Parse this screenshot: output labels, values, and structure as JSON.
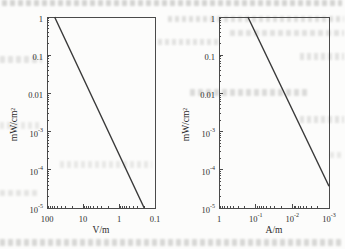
{
  "page": {
    "background_color": "#fcfcfb",
    "axis_color": "#4a4a4a",
    "text_color": "#2e2e2e"
  },
  "chart_data": [
    {
      "type": "line",
      "id": "power-density-vs-electric-field",
      "title": "",
      "xlabel": "V/m",
      "ylabel": "mW/cm²",
      "x_scale": "log",
      "y_scale": "log",
      "x_reversed": true,
      "x_range": [
        100,
        0.1
      ],
      "y_range": [
        1,
        1e-05
      ],
      "grid": false,
      "minor_ticks": true,
      "tick_direction": "in",
      "frame": "box",
      "x_ticks": [
        {
          "value": 100,
          "base": "100",
          "exp": ""
        },
        {
          "value": 10,
          "base": "10",
          "exp": ""
        },
        {
          "value": 1,
          "base": "1",
          "exp": ""
        },
        {
          "value": 0.1,
          "base": "0.1",
          "exp": ""
        }
      ],
      "y_ticks": [
        {
          "value": 1,
          "base": "1",
          "exp": ""
        },
        {
          "value": 0.1,
          "base": "0.1",
          "exp": ""
        },
        {
          "value": 0.01,
          "base": "0.01",
          "exp": ""
        },
        {
          "value": 0.001,
          "base": "10",
          "exp": "-3"
        },
        {
          "value": 0.0001,
          "base": "10",
          "exp": "-4"
        },
        {
          "value": 1e-05,
          "base": "10",
          "exp": "-5"
        }
      ],
      "series": [
        {
          "name": "power-density-vs-E-field-line",
          "color": "#383838",
          "points": [
            [
              61.4,
              1
            ],
            [
              0.2,
              1e-05
            ]
          ]
        }
      ]
    },
    {
      "type": "line",
      "id": "power-density-vs-magnetic-field",
      "title": "",
      "xlabel": "A/m",
      "ylabel": "mW/cm²",
      "x_scale": "log",
      "y_scale": "log",
      "x_reversed": true,
      "x_range": [
        1,
        0.001
      ],
      "y_range": [
        1,
        1e-05
      ],
      "grid": false,
      "minor_ticks": true,
      "tick_direction": "in",
      "frame": "box",
      "x_ticks": [
        {
          "value": 1,
          "base": "1",
          "exp": ""
        },
        {
          "value": 0.1,
          "base": "10",
          "exp": "-1"
        },
        {
          "value": 0.01,
          "base": "10",
          "exp": "-2"
        },
        {
          "value": 0.001,
          "base": "10",
          "exp": "-3"
        }
      ],
      "y_ticks": [
        {
          "value": 1,
          "base": "1",
          "exp": ""
        },
        {
          "value": 0.1,
          "base": "0.1",
          "exp": ""
        },
        {
          "value": 0.01,
          "base": "0.01",
          "exp": ""
        },
        {
          "value": 0.001,
          "base": "10",
          "exp": "-3"
        },
        {
          "value": 0.0001,
          "base": "10",
          "exp": "-4"
        },
        {
          "value": 1e-05,
          "base": "10",
          "exp": "-5"
        }
      ],
      "series": [
        {
          "name": "power-density-vs-H-field-line",
          "color": "#383838",
          "points": [
            [
              0.163,
              1
            ],
            [
              0.001,
              3.7e-05
            ]
          ]
        }
      ]
    }
  ]
}
